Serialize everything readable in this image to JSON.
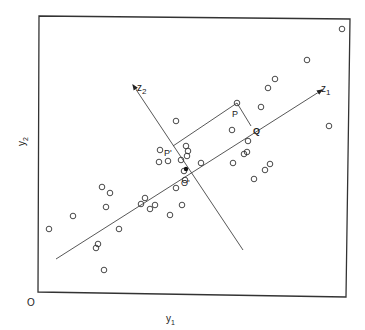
{
  "diagram": {
    "type": "scatter-with-rotated-axes",
    "labels": {
      "origin": "O",
      "x_axis": "y",
      "x_axis_sub": "1",
      "y_axis": "y",
      "y_axis_sub": "2",
      "z1": "z",
      "z1_sub": "1",
      "z2": "z",
      "z2_sub": "2",
      "P": "P",
      "P_prime": "P'",
      "Q": "Q",
      "O_prime": "O'"
    },
    "colors": {
      "ink": "#333333",
      "background": "#ffffff"
    },
    "frame": {
      "x1": 39,
      "y1": 16,
      "x2": 350,
      "y2": 19,
      "x3": 346,
      "y3": 297,
      "x4": 38,
      "y4": 292
    },
    "z1_axis": {
      "from": [
        56,
        259
      ],
      "to": [
        322,
        90
      ]
    },
    "z2_axis": {
      "from": [
        243,
        250
      ],
      "to": [
        133,
        85
      ]
    },
    "center": [
      186,
      169
    ],
    "projection_lines": [
      {
        "from": [
          237,
          103
        ],
        "to": [
          251,
          126
        ]
      },
      {
        "from": [
          237,
          103
        ],
        "to": [
          173,
          146
        ]
      }
    ],
    "points": [
      [
        342,
        29
      ],
      [
        307,
        60
      ],
      [
        275,
        79
      ],
      [
        268,
        88
      ],
      [
        329,
        126
      ],
      [
        261,
        107
      ],
      [
        237,
        103
      ],
      [
        232,
        130
      ],
      [
        248,
        141
      ],
      [
        247,
        152
      ],
      [
        244,
        154
      ],
      [
        233,
        163
      ],
      [
        270,
        164
      ],
      [
        265,
        170
      ],
      [
        254,
        179
      ],
      [
        176,
        121
      ],
      [
        160,
        150
      ],
      [
        186,
        146
      ],
      [
        188,
        151
      ],
      [
        187,
        156
      ],
      [
        181,
        160
      ],
      [
        201,
        163
      ],
      [
        184,
        171
      ],
      [
        185,
        180
      ],
      [
        176,
        188
      ],
      [
        159,
        162
      ],
      [
        168,
        161
      ],
      [
        182,
        205
      ],
      [
        170,
        215
      ],
      [
        141,
        204
      ],
      [
        150,
        209
      ],
      [
        155,
        205
      ],
      [
        145,
        198
      ],
      [
        102,
        187
      ],
      [
        110,
        193
      ],
      [
        106,
        207
      ],
      [
        73,
        216
      ],
      [
        49,
        229
      ],
      [
        119,
        229
      ],
      [
        98,
        244
      ],
      [
        96,
        248
      ],
      [
        104,
        270
      ]
    ]
  }
}
